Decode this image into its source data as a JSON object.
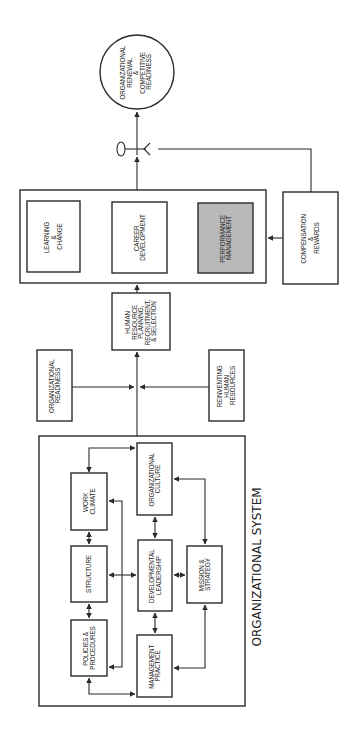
{
  "diagram": {
    "type": "flow-diagram",
    "orientation": "rotated-90-ccw",
    "accent_fill": "#b9b9b9",
    "outcome": {
      "lines": [
        "ORGANIZATIONAL",
        "RENEWAL",
        "&",
        "COMPETITIVE",
        "READINESS"
      ]
    },
    "key_symbol": "key-icon",
    "hr_programs": {
      "learning": {
        "lines": [
          "LEARNING",
          "&",
          "CHANGE"
        ]
      },
      "career": {
        "lines": [
          "CAREER",
          "DEVELOPMENT"
        ]
      },
      "performance": {
        "lines": [
          "PERFORMANCE",
          "MANAGEMENT"
        ]
      }
    },
    "compensation": {
      "lines": [
        "COMPENSATION",
        "&",
        "REWARDS"
      ]
    },
    "hr_planning": {
      "lines": [
        "HUMAN",
        "RESOURCE",
        "PLANNING,",
        "RECRUITMENT,",
        "& SELECTION"
      ]
    },
    "org_readiness": {
      "lines": [
        "ORGANIZATIONAL",
        "READINESS"
      ]
    },
    "reinventing": {
      "lines": [
        "REINVENTING",
        "HUMAN",
        "RESOURCES"
      ]
    },
    "org_system": {
      "title": "ORGANIZATIONAL SYSTEM",
      "work_climate": {
        "lines": [
          "WORK",
          "CLIMATE"
        ]
      },
      "structure": {
        "lines": [
          "STRUCTURE"
        ]
      },
      "policies": {
        "lines": [
          "POLICIES &",
          "PROCEDURES"
        ]
      },
      "culture": {
        "lines": [
          "ORGANIZATIONAL",
          "CULTURE"
        ]
      },
      "leadership": {
        "lines": [
          "DEVELOPMENTAL",
          "LEADERSHIP"
        ]
      },
      "management": {
        "lines": [
          "MANAGEMENT",
          "PRACTICE"
        ]
      },
      "mission": {
        "lines": [
          "MISSION &",
          "STRATEGY"
        ]
      }
    }
  }
}
